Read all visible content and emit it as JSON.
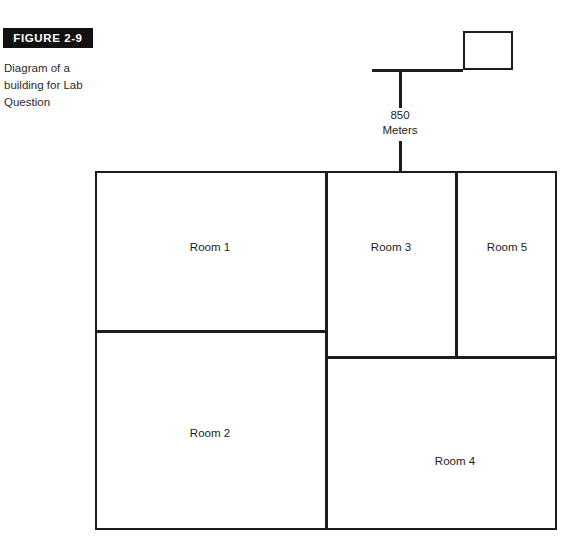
{
  "figure": {
    "tag": "FIGURE 2-9",
    "caption": "Diagram of a building for Lab Question"
  },
  "antenna": {
    "distance_value": "850",
    "distance_unit": "Meters"
  },
  "building": {
    "rooms": [
      {
        "label": "Room 1"
      },
      {
        "label": "Room 2"
      },
      {
        "label": "Room 3"
      },
      {
        "label": "Room 4"
      },
      {
        "label": "Room 5"
      }
    ]
  },
  "colors": {
    "line": "#1d1d1d",
    "tag_background": "#111111",
    "tag_text": "#ffffff",
    "page_background": "#ffffff"
  }
}
